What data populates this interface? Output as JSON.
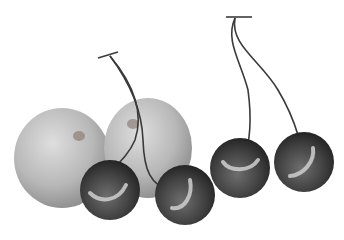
{
  "scene": {
    "description": "Grayscale illustration of two apricots/apples with four cherries on stems",
    "background": "#ffffff",
    "colors": {
      "fruit_light": "#d6d6d6",
      "fruit_mid": "#b4b4b4",
      "fruit_dark": "#8e8e8e",
      "cherry_light": "#6a6a6a",
      "cherry_dark": "#262626",
      "highlight": "#cfcfcf",
      "stem": "#3a3a3a"
    },
    "objects": [
      {
        "type": "apple",
        "label": "left apple",
        "cx": 62,
        "cy": 158,
        "rx": 48,
        "ry": 50
      },
      {
        "type": "apple",
        "label": "right apple",
        "cx": 148,
        "cy": 148,
        "rx": 44,
        "ry": 50
      },
      {
        "type": "cherry",
        "label": "cherry 1",
        "cx": 110,
        "cy": 190,
        "r": 30
      },
      {
        "type": "cherry",
        "label": "cherry 2",
        "cx": 185,
        "cy": 195,
        "r": 30
      },
      {
        "type": "cherry",
        "label": "cherry 3",
        "cx": 240,
        "cy": 168,
        "r": 30
      },
      {
        "type": "cherry",
        "label": "cherry 4",
        "cx": 304,
        "cy": 162,
        "r": 30
      }
    ]
  }
}
